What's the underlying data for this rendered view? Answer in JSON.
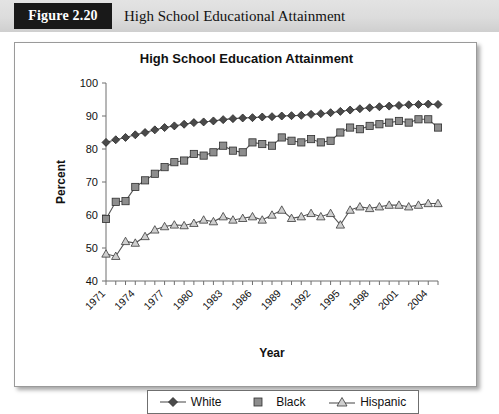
{
  "header": {
    "figure_tag": "Figure 2.20",
    "figure_title": "High School Educational Attainment"
  },
  "chart_data": {
    "type": "line",
    "title": "High School Education Attainment",
    "xlabel": "Year",
    "ylabel": "Percent",
    "ylim": [
      40,
      100
    ],
    "yticks": [
      40,
      50,
      60,
      70,
      80,
      90,
      100
    ],
    "xlim": [
      1971,
      2005
    ],
    "xtick_labels": [
      "1971",
      "1974",
      "1977",
      "1980",
      "1983",
      "1986",
      "1989",
      "1992",
      "1995",
      "1998",
      "2001",
      "2004"
    ],
    "xtick_label_rotation": -45,
    "grid": false,
    "legend_position": "bottom",
    "x": [
      1971,
      1972,
      1973,
      1974,
      1975,
      1976,
      1977,
      1978,
      1979,
      1980,
      1981,
      1982,
      1983,
      1984,
      1985,
      1986,
      1987,
      1988,
      1989,
      1990,
      1991,
      1992,
      1993,
      1994,
      1995,
      1996,
      1997,
      1998,
      1999,
      2000,
      2001,
      2002,
      2003,
      2004,
      2005
    ],
    "series": [
      {
        "name": "White",
        "marker": "diamond",
        "color": "#4a4a4a",
        "values": [
          82.0,
          82.8,
          83.5,
          84.3,
          85.0,
          85.8,
          86.5,
          87.0,
          87.5,
          88.0,
          88.2,
          88.5,
          88.9,
          89.2,
          89.4,
          89.5,
          89.7,
          89.8,
          90.0,
          90.1,
          90.2,
          90.5,
          90.7,
          91.0,
          91.4,
          91.8,
          92.2,
          92.5,
          92.8,
          93.0,
          93.2,
          93.4,
          93.5,
          93.6,
          93.5
        ]
      },
      {
        "name": "Black",
        "marker": "square",
        "color": "#8d8d8d",
        "values": [
          58.8,
          64.0,
          64.2,
          68.5,
          70.5,
          72.5,
          74.5,
          76.0,
          76.5,
          78.5,
          78.0,
          79.0,
          81.0,
          79.5,
          79.0,
          82.0,
          81.5,
          81.0,
          83.5,
          82.5,
          82.0,
          83.0,
          82.0,
          82.5,
          85.0,
          86.5,
          86.0,
          87.0,
          87.5,
          88.0,
          88.5,
          88.0,
          89.0,
          89.0,
          86.5
        ]
      },
      {
        "name": "Hispanic",
        "marker": "triangle",
        "color": "#cfcfcf",
        "values": [
          48.2,
          47.5,
          52.0,
          51.5,
          53.5,
          55.5,
          56.5,
          57.0,
          56.8,
          57.5,
          58.5,
          58.0,
          59.5,
          58.5,
          59.0,
          59.5,
          58.5,
          60.0,
          61.5,
          59.0,
          59.5,
          60.5,
          59.5,
          60.5,
          57.0,
          61.5,
          62.5,
          62.0,
          62.5,
          63.0,
          63.0,
          62.5,
          63.0,
          63.5,
          63.5
        ]
      }
    ]
  },
  "legend": {
    "items": [
      {
        "label": "White",
        "marker": "diamond"
      },
      {
        "label": "Black",
        "marker": "square"
      },
      {
        "label": "Hispanic",
        "marker": "triangle"
      }
    ]
  }
}
